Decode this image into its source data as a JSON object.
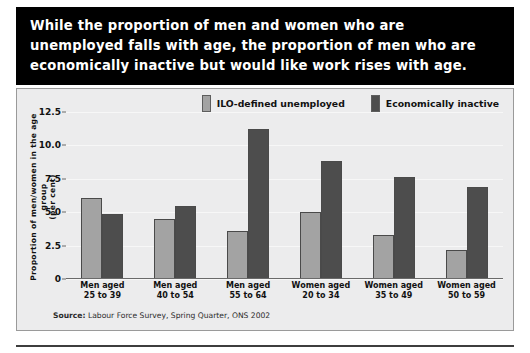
{
  "title": {
    "lines": [
      "While the proportion of men and women who are",
      "unemployed falls with age, the proportion of men who are",
      "economically inactive but would like work rises with age."
    ]
  },
  "legend": {
    "items": [
      {
        "label": "ILO-defined unemployed",
        "color": "#a3a3a3"
      },
      {
        "label": "Economically inactive",
        "color": "#4d4d4d"
      }
    ]
  },
  "axis": {
    "y_title_line1": "Proportion of men/women in the age group",
    "y_title_line2": "(per cent)",
    "y_ticks": [
      "12.5",
      "10.0",
      "7.5",
      "5.0",
      "2.5",
      "0"
    ]
  },
  "source": {
    "prefix": "Source:",
    "text": "Labour Force Survey, Spring Quarter, ONS 2002"
  },
  "chart_data": {
    "type": "bar",
    "title": "While the proportion of men and women who are unemployed falls with age, the proportion of men who are economically inactive but would like work rises with age.",
    "xlabel": "",
    "ylabel": "Proportion of men/women in the age group (per cent)",
    "ylim": [
      0,
      12.5
    ],
    "yticks": [
      0,
      2.5,
      5.0,
      7.5,
      10.0,
      12.5
    ],
    "grid": true,
    "legend_position": "top-right",
    "categories": [
      "Men aged 25 to 39",
      "Men aged 40 to 54",
      "Men aged 55 to 64",
      "Women aged 20 to 34",
      "Women aged 35 to 49",
      "Women aged 50 to 59"
    ],
    "category_lines": [
      [
        "Men aged",
        "25 to 39"
      ],
      [
        "Men aged",
        "40 to 54"
      ],
      [
        "Men aged",
        "55 to 64"
      ],
      [
        "Women aged",
        "20 to 34"
      ],
      [
        "Women aged",
        "35 to 49"
      ],
      [
        "Women aged",
        "50 to 59"
      ]
    ],
    "series": [
      {
        "name": "ILO-defined unemployed",
        "color": "#a3a3a3",
        "values": [
          6.1,
          4.5,
          3.6,
          5.0,
          3.3,
          2.2
        ]
      },
      {
        "name": "Economically inactive",
        "color": "#4d4d4d",
        "values": [
          4.9,
          5.5,
          11.2,
          8.8,
          7.6,
          6.9
        ]
      }
    ],
    "source": "Source: Labour Force Survey, Spring Quarter, ONS 2002"
  }
}
